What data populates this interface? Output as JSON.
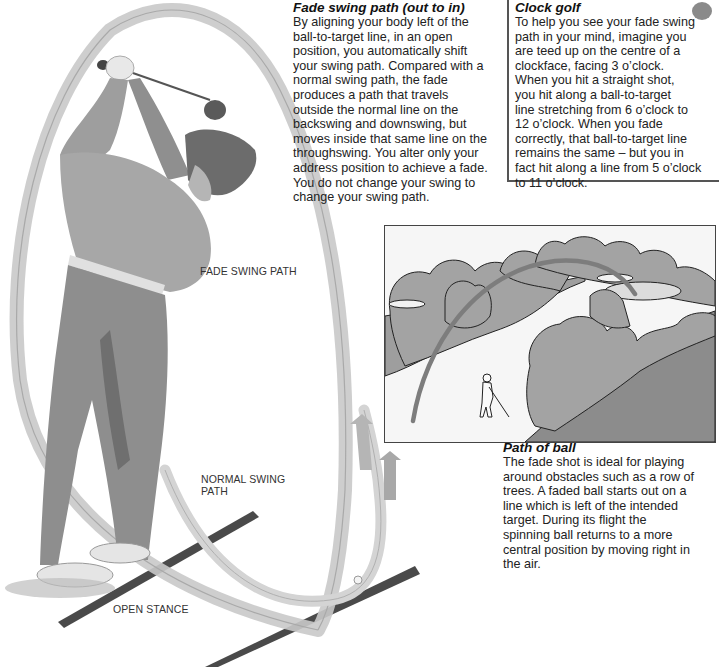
{
  "fade_section": {
    "heading": "Fade swing path (out to in)",
    "lines": [
      "By aligning your body left of the",
      "ball-to-target line, in an open",
      "position, you automatically shift",
      "your swing path. Compared with a",
      "normal swing path, the fade",
      "produces a path that travels",
      "outside the normal line on the",
      "backswing and downswing, but",
      "moves inside that same line on the",
      "throughswing. You alter only your",
      "address position to achieve a fade.",
      "You do not change your swing to",
      "change your swing path."
    ]
  },
  "clock_section": {
    "heading": "Clock golf",
    "lines": [
      "To help you see your fade swing",
      "path in your mind,  imagine you",
      "are teed up on the centre of a",
      "clockface, facing 3 o’clock.",
      "When you hit a straight shot,",
      "you hit along a ball-to-target",
      "line stretching from 6 o’clock to",
      "12 o’clock. When you fade",
      "correctly, that ball-to-target line",
      "remains the same – but you in",
      "fact hit along a line from 5 o’clock",
      "to 11 o’clock."
    ]
  },
  "ball_section": {
    "heading": "Path of ball",
    "lines": [
      "The fade shot is ideal for playing",
      "around obstacles such as a row of",
      "trees. A faded ball starts out on a",
      "line which is left of the intended",
      "target. During its flight the",
      "spinning ball returns to a more",
      "central position by moving right in",
      "the air."
    ]
  },
  "labels": {
    "fade_swing_path": "FADE SWING PATH",
    "normal_swing_path_1": "NORMAL SWING",
    "normal_swing_path_2": "PATH",
    "open_stance": "OPEN STANCE"
  },
  "colors": {
    "ink": "#1e1e1e",
    "illustration_gray": "#9a9a9a",
    "tree_fill": "#a3a3a3",
    "tree_dark": "#8c8c8c",
    "ribbon": "#c9c9c9",
    "ball_path": "#7d7d7d",
    "stance_line": "#4a4a4a"
  }
}
